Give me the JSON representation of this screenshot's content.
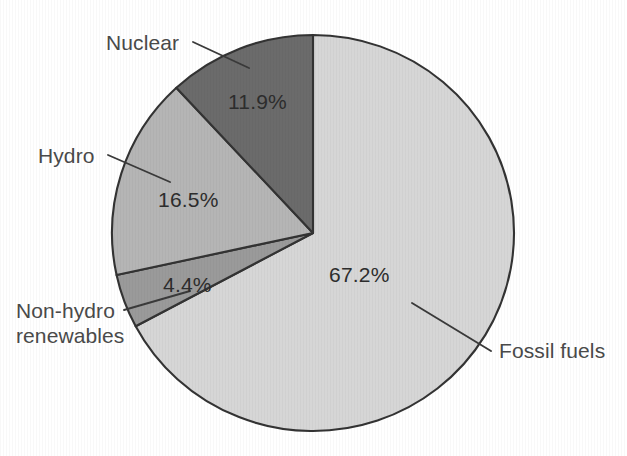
{
  "chart_data": {
    "type": "pie",
    "title": "",
    "subtitle": "",
    "xlabel": "",
    "ylabel": "",
    "legend_position": "none",
    "grid": false,
    "start_angle_deg": 0,
    "direction": "clockwise",
    "categories": [
      "Fossil fuels",
      "Nuclear",
      "Hydro",
      "Non-hydro renewables"
    ],
    "values": [
      67.2,
      11.9,
      16.5,
      4.4
    ],
    "value_labels": [
      "67.2%",
      "11.9%",
      "16.5%",
      "4.4%"
    ],
    "colors": [
      "#d6d6d6",
      "#6b6b6b",
      "#b5b5b5",
      "#9a9a9a"
    ],
    "slices": [
      {
        "name": "Fossil fuels",
        "value": 67.2,
        "value_label": "67.2%",
        "color": "#d6d6d6",
        "start_deg": 0,
        "end_deg": 241.92,
        "label_has_leader": true
      },
      {
        "name": "Non-hydro renewables",
        "value": 4.4,
        "value_label": "4.4%",
        "color": "#9a9a9a",
        "start_deg": 241.92,
        "end_deg": 257.76,
        "label_has_leader": true
      },
      {
        "name": "Hydro",
        "value": 16.5,
        "value_label": "16.5%",
        "color": "#b5b5b5",
        "start_deg": 257.76,
        "end_deg": 317.16,
        "label_has_leader": true
      },
      {
        "name": "Nuclear",
        "value": 11.9,
        "value_label": "11.9%",
        "color": "#6b6b6b",
        "start_deg": 317.16,
        "end_deg": 360,
        "label_has_leader": true
      }
    ]
  },
  "labels": {
    "nuclear": "Nuclear",
    "hydro": "Hydro",
    "non_hydro_line1": "Non-hydro",
    "non_hydro_line2": "renewables",
    "fossil_fuels": "Fossil fuels"
  },
  "values": {
    "nuclear_pct": "11.9%",
    "hydro_pct": "16.5%",
    "non_hydro_pct": "4.4%",
    "fossil_fuels_pct": "67.2%"
  },
  "style": {
    "background": "#ffffff",
    "outline": "#333333",
    "fossil_fuels_color": "#d6d6d6",
    "nuclear_color": "#6b6b6b",
    "hydro_color": "#b5b5b5",
    "non_hydro_color": "#9a9a9a",
    "label_text_color": "#4a4a4a",
    "value_text_color": "#2d2d2d"
  }
}
